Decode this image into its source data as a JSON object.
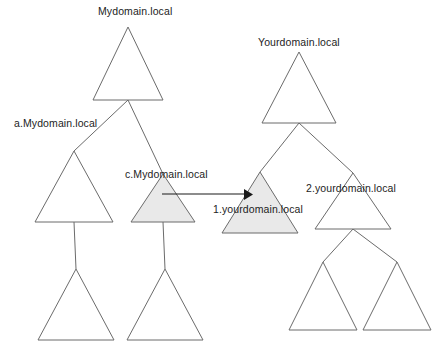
{
  "diagram": {
    "type": "domain-forest-tree-diagram",
    "canvas": {
      "width": 440,
      "height": 350,
      "background": "#ffffff"
    },
    "colors": {
      "outline": "#6b6b6b",
      "shaded_fill": "#e9e9e9",
      "arrow": "#1a1a1a",
      "label_text": "#1d1d1d",
      "background": "#ffffff"
    },
    "forests": [
      {
        "name": "Mydomain.local forest",
        "root": "Mydomain.local"
      },
      {
        "name": "Yourdomain.local forest",
        "root": "Yourdomain.local"
      }
    ],
    "labels": {
      "mydomain_root": "Mydomain.local",
      "a_mydomain": "a.Mydomain.local",
      "c_mydomain": "c.Mydomain.local",
      "yourdomain_root": "Yourdomain.local",
      "one_yourdomain": "1.yourdomain.local",
      "two_yourdomain": "2.yourdomain.local"
    },
    "nodes": [
      {
        "id": "mydomain-root",
        "label": "Mydomain.local",
        "shaded": false,
        "apex_x": 128,
        "apex_y": 27,
        "base_y": 100,
        "half_width": 35
      },
      {
        "id": "a-mydomain",
        "label": "a.Mydomain.local",
        "shaded": false,
        "apex_x": 74,
        "apex_y": 151,
        "base_y": 222,
        "half_width": 39
      },
      {
        "id": "c-mydomain",
        "label": "c.Mydomain.local",
        "shaded": true,
        "apex_x": 163,
        "apex_y": 174,
        "base_y": 222,
        "half_width": 32
      },
      {
        "id": "a-child-left",
        "label": "",
        "shaded": false,
        "apex_x": 76,
        "apex_y": 269,
        "base_y": 340,
        "half_width": 38
      },
      {
        "id": "c-child",
        "label": "",
        "shaded": false,
        "apex_x": 165,
        "apex_y": 269,
        "base_y": 340,
        "half_width": 38
      },
      {
        "id": "yourdomain-root",
        "label": "Yourdomain.local",
        "shaded": false,
        "apex_x": 299,
        "apex_y": 52,
        "base_y": 123,
        "half_width": 37
      },
      {
        "id": "one-yourdomain",
        "label": "1.yourdomain.local",
        "shaded": true,
        "apex_x": 260,
        "apex_y": 172,
        "base_y": 233,
        "half_width": 38
      },
      {
        "id": "two-yourdomain",
        "label": "2.yourdomain.local",
        "shaded": false,
        "apex_x": 353,
        "apex_y": 173,
        "base_y": 229,
        "half_width": 38
      },
      {
        "id": "two-child-left",
        "label": "",
        "shaded": false,
        "apex_x": 323,
        "apex_y": 262,
        "base_y": 330,
        "half_width": 34
      },
      {
        "id": "two-child-right",
        "label": "",
        "shaded": false,
        "apex_x": 397,
        "apex_y": 262,
        "base_y": 330,
        "half_width": 34
      }
    ],
    "edges": [
      {
        "from": "mydomain-root",
        "to": "a-mydomain"
      },
      {
        "from": "mydomain-root",
        "to": "c-mydomain"
      },
      {
        "from": "a-mydomain",
        "to": "a-child-left"
      },
      {
        "from": "c-mydomain",
        "to": "c-child"
      },
      {
        "from": "yourdomain-root",
        "to": "one-yourdomain"
      },
      {
        "from": "yourdomain-root",
        "to": "two-yourdomain"
      },
      {
        "from": "two-yourdomain",
        "to": "two-child-left"
      },
      {
        "from": "two-yourdomain",
        "to": "two-child-right"
      }
    ],
    "arrow": {
      "name": "trust-arrow",
      "from_node": "c-mydomain",
      "to_node": "one-yourdomain",
      "x1": 162,
      "y1": 194,
      "x2": 251,
      "y2": 194,
      "direction": "right"
    }
  }
}
